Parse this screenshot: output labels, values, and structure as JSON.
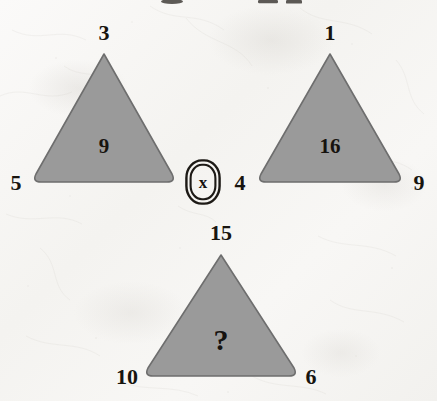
{
  "puzzle": {
    "type": "triangle-number-logic-puzzle",
    "medium": "scanned textured paper",
    "background_color": "#f7f6f4",
    "shape_fill_color": "#9a9a9a",
    "shape_stroke_color": "#6f6f6f",
    "text_color": "#17140f",
    "unknown_marker": "?",
    "operator_symbol": "x",
    "top_cropped_text": ""
  },
  "triangles": [
    {
      "id": "triangle-left",
      "apex": "3",
      "bottom_left": "5",
      "bottom_right": "",
      "center": "9"
    },
    {
      "id": "triangle-right",
      "apex": "1",
      "bottom_left": "4",
      "bottom_right": "9",
      "center": "16"
    },
    {
      "id": "triangle-bottom",
      "apex": "15",
      "bottom_left": "10",
      "bottom_right": "6",
      "center": "?"
    }
  ],
  "operator": {
    "label": "x",
    "name": "multiplication-operator"
  }
}
